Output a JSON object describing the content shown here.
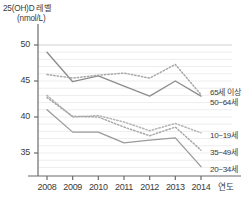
{
  "chart_data": {
    "type": "line",
    "title": "25(OH)D 레벨",
    "subtitle": "(nmol/L)",
    "ylabel": "25(OH)D 레벨 (nmol/L)",
    "xlabel": "연도",
    "categories": [
      "2008",
      "2009",
      "2010",
      "2011",
      "2012",
      "2013",
      "2014"
    ],
    "x": [
      2008,
      2009,
      2010,
      2011,
      2012,
      2013,
      2014
    ],
    "ylim": [
      32,
      51
    ],
    "yticks": [
      35,
      40,
      45,
      50
    ],
    "grid": true,
    "legend_position": "right-inline",
    "series": [
      {
        "name": "65세 이상",
        "style": "solid",
        "color": "#8c8c8c",
        "values": [
          49.0,
          44.9,
          45.7,
          44.3,
          42.9,
          45.0,
          42.9
        ]
      },
      {
        "name": "50~64세",
        "style": "dotted",
        "color": "#a8a8a8",
        "values": [
          45.9,
          45.4,
          45.8,
          46.1,
          45.4,
          47.3,
          43.1
        ]
      },
      {
        "name": "10~19세",
        "style": "dotted",
        "color": "#b4b4b4",
        "values": [
          43.0,
          40.0,
          40.2,
          39.3,
          38.1,
          39.1,
          37.8
        ]
      },
      {
        "name": "35~49세",
        "style": "dotted",
        "color": "#a8a8a8",
        "values": [
          42.7,
          40.1,
          40.0,
          38.6,
          37.4,
          38.6,
          35.4
        ]
      },
      {
        "name": "20~34세",
        "style": "solid",
        "color": "#9a9a9a",
        "values": [
          41.0,
          37.9,
          37.9,
          36.4,
          36.8,
          37.1,
          33.1
        ]
      }
    ]
  },
  "axis": {
    "y_tick_labels": [
      "50",
      "45",
      "40",
      "35"
    ],
    "x_tick_labels": [
      "2008",
      "2009",
      "2010",
      "2011",
      "2012",
      "2013",
      "2014"
    ],
    "x_axis_name": "연도"
  },
  "legend_labels": [
    "65세 이상",
    "50~64세",
    "10~19세",
    "35~49세",
    "20~34세"
  ],
  "colors": {
    "axis": "#6b6b6b",
    "grid": "#ededed",
    "text": "#3a3a3a",
    "background": "#ffffff"
  }
}
